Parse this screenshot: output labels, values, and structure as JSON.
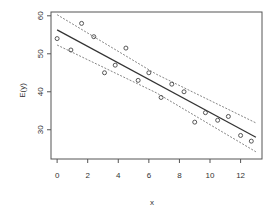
{
  "chart_data": {
    "type": "scatter",
    "title": "",
    "xlabel": "x",
    "ylabel": "E(y)",
    "xlim": [
      -0.4,
      13.4
    ],
    "ylim": [
      22.3,
      61.0
    ],
    "xticks": [
      0,
      2,
      4,
      6,
      8,
      10,
      12
    ],
    "yticks": [
      30,
      40,
      50,
      60
    ],
    "grid": false,
    "legend": null,
    "series": [
      {
        "name": "observations",
        "kind": "points",
        "marker": "open-circle",
        "x": [
          0.0,
          0.9,
          1.6,
          2.4,
          3.1,
          3.8,
          4.5,
          5.3,
          6.0,
          6.8,
          7.5,
          8.3,
          9.0,
          9.7,
          10.5,
          11.2,
          12.0,
          12.7
        ],
        "y": [
          54.0,
          51.0,
          58.0,
          54.5,
          45.0,
          47.0,
          51.5,
          43.0,
          45.0,
          38.5,
          42.0,
          40.0,
          32.0,
          34.5,
          32.5,
          33.5,
          28.5,
          27.0
        ]
      },
      {
        "name": "fitted regression line",
        "kind": "line",
        "style": "solid",
        "x": [
          0.0,
          13.0
        ],
        "y": [
          56.3,
          28.0
        ]
      },
      {
        "name": "upper confidence band",
        "kind": "line",
        "style": "dashed",
        "x": [
          0.0,
          6.5,
          13.0
        ],
        "y": [
          60.3,
          44.6,
          31.8
        ]
      },
      {
        "name": "lower confidence band",
        "kind": "line",
        "style": "dashed",
        "x": [
          0.0,
          6.5,
          13.0
        ],
        "y": [
          52.3,
          39.7,
          24.2
        ]
      }
    ]
  },
  "colors": {
    "axis": "#555555",
    "points": "#444444",
    "fit_line": "#333333",
    "band_lines": "#666666"
  }
}
